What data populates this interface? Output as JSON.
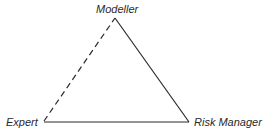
{
  "diagram": {
    "type": "triangle",
    "nodes": [
      {
        "id": "modeller",
        "label": "Modeller",
        "position": "top"
      },
      {
        "id": "expert",
        "label": "Expert",
        "position": "bottom-left"
      },
      {
        "id": "risk_manager",
        "label": "Risk Manager",
        "position": "bottom-right"
      }
    ],
    "edges": [
      {
        "from": "expert",
        "to": "modeller",
        "style": "dashed"
      },
      {
        "from": "modeller",
        "to": "risk_manager",
        "style": "solid"
      },
      {
        "from": "expert",
        "to": "risk_manager",
        "style": "solid"
      }
    ],
    "colors": {
      "line": "#2a2a2a",
      "text": "#2a2a2a",
      "background": "#ffffff"
    }
  }
}
